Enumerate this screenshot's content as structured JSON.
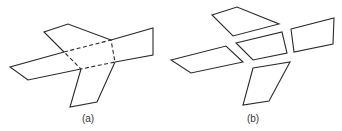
{
  "figure": {
    "panels": [
      {
        "label": "(a)",
        "description": "folded net: central quadrilateral (dashed fold lines) with four attached flaps",
        "label_pos": [
          88,
          113
        ]
      },
      {
        "label": "(b)",
        "description": "exploded view: five separate quadrilaterals",
        "label_pos": [
          253,
          113
        ]
      }
    ],
    "colors": {
      "stroke": "#2a2a2a",
      "background": "#ffffff"
    }
  }
}
